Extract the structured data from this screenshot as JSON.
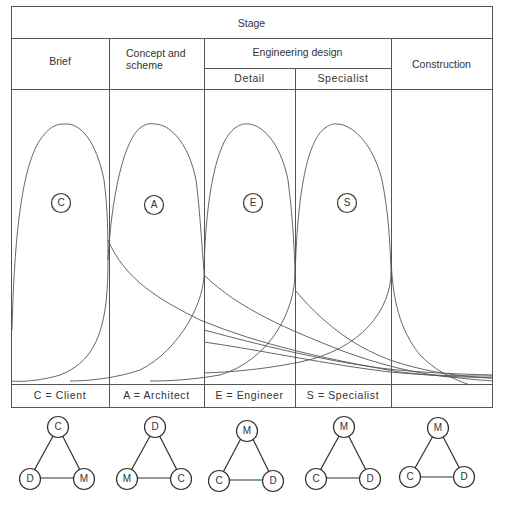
{
  "header": {
    "title": "Stage",
    "columns": [
      {
        "label": "Brief"
      },
      {
        "label": "Concept and scheme",
        "line1": "Concept and",
        "line2": "scheme"
      },
      {
        "label": "Engineering design",
        "sub": [
          "Detail",
          "Specialist"
        ]
      },
      {
        "label": "Construction"
      }
    ]
  },
  "curves": [
    {
      "key": "C",
      "label": "C",
      "peak_x": 67
    },
    {
      "key": "A",
      "label": "A",
      "peak_x": 155
    },
    {
      "key": "E",
      "label": "E",
      "peak_x": 248
    },
    {
      "key": "S",
      "label": "S",
      "peak_x": 337
    }
  ],
  "legend": [
    {
      "text": "C = Client"
    },
    {
      "text": "A = Architect"
    },
    {
      "text": "E = Engineer"
    },
    {
      "text": "S = Specialist"
    },
    {
      "text": ""
    }
  ],
  "triangles": [
    {
      "top": "C",
      "left": "D",
      "right": "M"
    },
    {
      "top": "D",
      "left": "M",
      "right": "C"
    },
    {
      "top": "M",
      "left": "C",
      "right": "D"
    },
    {
      "top": "M",
      "left": "C",
      "right": "D"
    },
    {
      "top": "M",
      "left": "C",
      "right": "D"
    }
  ],
  "colors": {
    "line": "#555555",
    "text": "#333333",
    "background": "#ffffff"
  }
}
